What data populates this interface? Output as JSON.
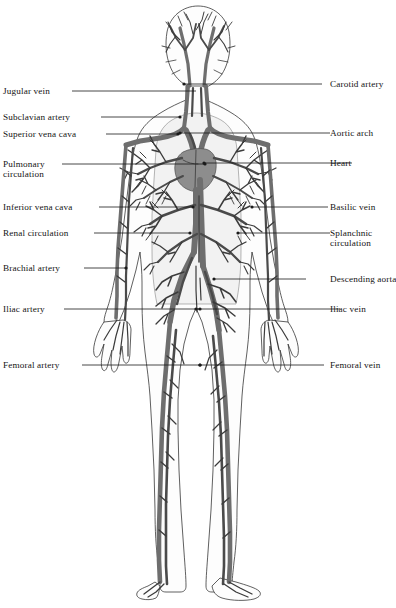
{
  "figure": {
    "background_color": "#ffffff",
    "ink_color": "#1a1a1a",
    "vessel_color": "#6e6e6e",
    "vessel_dark_color": "#4a4a4a",
    "organ_color": "#8d8d8d",
    "body_fill": "#fdfdfd"
  },
  "labels": {
    "left": [
      {
        "id": "jugular-vein",
        "text": "Jugular vein",
        "text2": "",
        "y": 91,
        "line_x1": 72,
        "line_x2": 196,
        "dot": false
      },
      {
        "id": "subclavian-artery",
        "text": "Subclavian artery",
        "text2": "",
        "y": 117,
        "line_x1": 101,
        "line_x2": 180,
        "dot": true
      },
      {
        "id": "superior-vena-cava",
        "text": "Superior vena cava",
        "text2": "",
        "y": 134,
        "line_x1": 106,
        "line_x2": 178,
        "dot": true
      },
      {
        "id": "pulmonary-circulation",
        "text": "Pulmonary",
        "text2": "circulation",
        "y": 164,
        "line_x1": 62,
        "line_x2": 205,
        "dot": true
      },
      {
        "id": "inferior-vena-cava",
        "text": "Inferior vena cava",
        "text2": "",
        "y": 207,
        "line_x1": 99,
        "line_x2": 193,
        "dot": true
      },
      {
        "id": "renal-circulation",
        "text": "Renal circulation",
        "text2": "",
        "y": 233,
        "line_x1": 94,
        "line_x2": 190,
        "dot": true
      },
      {
        "id": "brachial-artery",
        "text": "Brachial artery",
        "text2": "",
        "y": 268,
        "line_x1": 84,
        "line_x2": 126,
        "dot": true
      },
      {
        "id": "iliac-artery",
        "text": "Iliac artery",
        "text2": "",
        "y": 309,
        "line_x1": 64,
        "line_x2": 200,
        "dot": true
      },
      {
        "id": "femoral-artery",
        "text": "Femoral artery",
        "text2": "",
        "y": 365,
        "line_x1": 82,
        "line_x2": 200,
        "dot": true
      }
    ],
    "right": [
      {
        "id": "carotid-artery",
        "text": "Carotid artery",
        "text2": "",
        "y": 84,
        "line_x1": 184,
        "line_x2": 322,
        "dot": true
      },
      {
        "id": "aortic-arch",
        "text": "Aortic arch",
        "text2": "",
        "y": 133,
        "line_x1": 180,
        "line_x2": 330,
        "dot": true
      },
      {
        "id": "heart",
        "text": "Heart",
        "text2": "",
        "y": 163,
        "line_x1": 204,
        "line_x2": 352,
        "dot": true
      },
      {
        "id": "basilic-vein",
        "text": "Basilic vein",
        "text2": "",
        "y": 207,
        "line_x1": 252,
        "line_x2": 328,
        "dot": true
      },
      {
        "id": "splanchnic-circulation",
        "text": "Splanchnic",
        "text2": "circulation",
        "y": 233,
        "line_x1": 238,
        "line_x2": 330,
        "dot": true
      },
      {
        "id": "descending-aorta",
        "text": "Descending aorta",
        "text2": "",
        "y": 279,
        "line_x1": 214,
        "line_x2": 306,
        "dot": true
      },
      {
        "id": "iliac-vein",
        "text": "Iliac vein",
        "text2": "",
        "y": 309,
        "line_x1": 196,
        "line_x2": 340,
        "dot": true
      },
      {
        "id": "femoral-vein",
        "text": "Femoral vein",
        "text2": "",
        "y": 365,
        "line_x1": 200,
        "line_x2": 324,
        "dot": true
      }
    ]
  },
  "label_x": {
    "left_text": 3,
    "right_text": 330
  }
}
